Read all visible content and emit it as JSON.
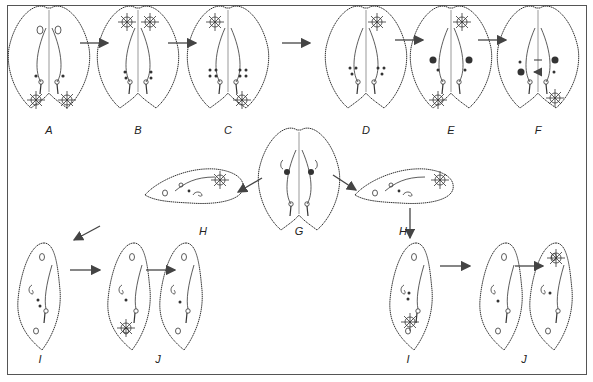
{
  "figure": {
    "stages": [
      {
        "id": "A",
        "label": "A",
        "x": 49,
        "y": 121
      },
      {
        "id": "B",
        "label": "B",
        "x": 138,
        "y": 121
      },
      {
        "id": "C",
        "label": "C",
        "x": 228,
        "y": 121
      },
      {
        "id": "D",
        "label": "D",
        "x": 366,
        "y": 121
      },
      {
        "id": "E",
        "label": "E",
        "x": 451,
        "y": 121
      },
      {
        "id": "F",
        "label": "F",
        "x": 538,
        "y": 121
      },
      {
        "id": "G",
        "label": "G",
        "x": 299,
        "y": 222
      },
      {
        "id": "H_left",
        "label": "H",
        "x": 203,
        "y": 222
      },
      {
        "id": "H_right",
        "label": "H",
        "x": 403,
        "y": 222
      },
      {
        "id": "I_left",
        "label": "I",
        "x": 40,
        "y": 350
      },
      {
        "id": "J_left",
        "label": "J",
        "x": 158,
        "y": 350
      },
      {
        "id": "I_right",
        "label": "I",
        "x": 408,
        "y": 350
      },
      {
        "id": "J_right",
        "label": "J",
        "x": 524,
        "y": 350
      }
    ],
    "colors": {
      "line": "#333333",
      "frame": "#555555",
      "fill": "#ffffff",
      "nucleus": "#333333"
    }
  }
}
